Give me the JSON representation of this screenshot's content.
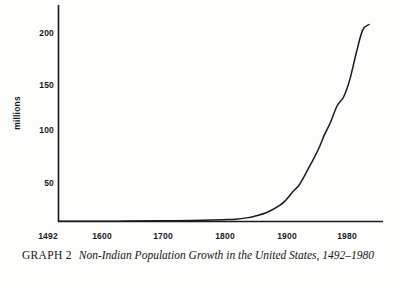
{
  "figure": {
    "caption_label": "GRAPH 2",
    "caption_title": "Non-Indian Population Growth in the United States, 1492–1980",
    "background_color": "#fdfdfc",
    "line_color": "#1a1a1a",
    "axis_color": "#1a1a1a"
  },
  "chart_data": {
    "type": "line",
    "title": "Non-Indian Population Growth in the United States, 1492–1980",
    "xlabel": "",
    "ylabel": "millions",
    "xlim": [
      1492,
      2000
    ],
    "ylim": [
      0,
      220
    ],
    "grid": false,
    "legend": null,
    "x_ticks": [
      1492,
      1600,
      1700,
      1800,
      1900,
      1980
    ],
    "x_tick_labels": [
      "1492",
      "1600",
      "1700",
      "1800",
      "1900",
      "1980"
    ],
    "y_ticks": [
      50,
      100,
      150,
      200
    ],
    "y_tick_labels": [
      "50",
      "100",
      "150",
      "200"
    ],
    "series": [
      {
        "name": "Non-Indian population",
        "x": [
          1492,
          1550,
          1600,
          1650,
          1700,
          1750,
          1770,
          1790,
          1800,
          1820,
          1840,
          1850,
          1860,
          1870,
          1880,
          1890,
          1900,
          1910,
          1920,
          1930,
          1940,
          1950,
          1960,
          1970,
          1980
        ],
        "y": [
          0,
          0.1,
          0.2,
          0.5,
          0.9,
          1.7,
          2.2,
          3.9,
          5.3,
          9.6,
          17.1,
          23.2,
          31.4,
          38.6,
          50.2,
          62.9,
          76.0,
          92.0,
          106.0,
          123.0,
          132.0,
          151.0,
          179.0,
          203.0,
          209.0
        ]
      }
    ],
    "annotations": []
  }
}
